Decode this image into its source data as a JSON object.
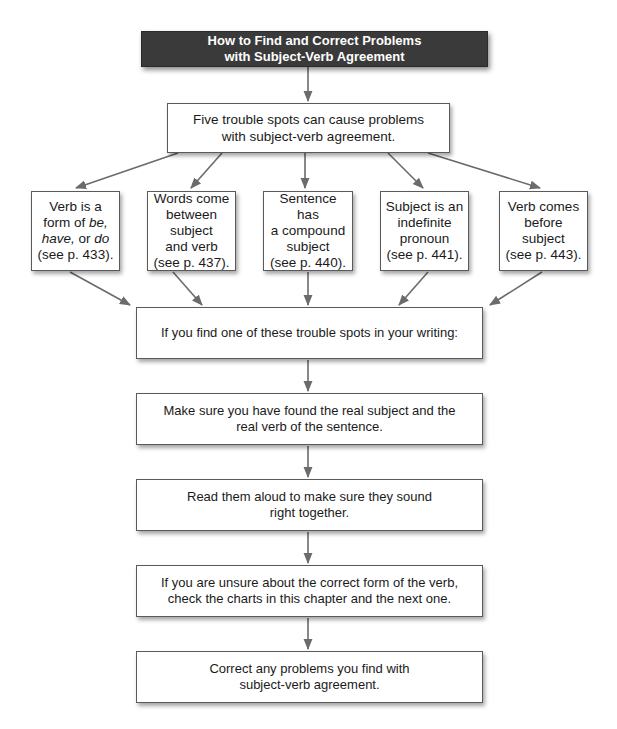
{
  "title": {
    "line1": "How to Find and Correct Problems",
    "line2": "with Subject-Verb Agreement"
  },
  "intro_box": {
    "text": "Five trouble spots can cause problems\nwith subject-verb agreement."
  },
  "trouble_spots": [
    {
      "line1": "Verb is a",
      "line2_pre": "form of ",
      "line2_em": "be,",
      "line3_em1": "have,",
      "line3_mid": " or ",
      "line3_em2": "do",
      "line4": "(see p. 433)."
    },
    {
      "text": "Words come\nbetween\nsubject\nand verb\n(see p. 437)."
    },
    {
      "text": "Sentence has\na compound\nsubject\n(see p. 440)."
    },
    {
      "text": "Subject is an\nindefinite\npronoun\n(see p. 441)."
    },
    {
      "text": "Verb comes\nbefore\nsubject\n(see p. 443)."
    }
  ],
  "steps": [
    {
      "text": "If you find one of these trouble spots in your writing:"
    },
    {
      "text": "Make sure you have found the real subject and the\nreal verb of the sentence."
    },
    {
      "text": "Read them aloud to make sure they sound\nright together."
    },
    {
      "text": "If you are unsure about the correct form of the verb,\ncheck the charts in this chapter and the next one."
    },
    {
      "text": "Correct any problems you find with\nsubject-verb agreement."
    }
  ],
  "colors": {
    "title_bg": "#3a3a3a",
    "title_text": "#ffffff",
    "border": "#5a5a5a",
    "arrow": "#6b6b6b"
  }
}
